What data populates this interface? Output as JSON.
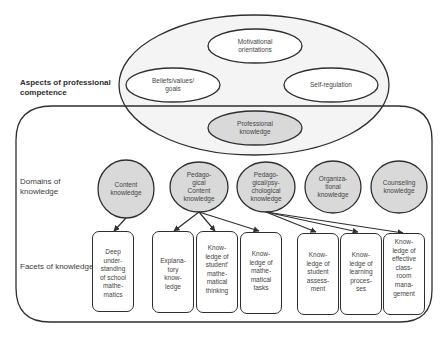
{
  "labels": {
    "aspects": "Aspects of professional\ncompetence",
    "domains": "Domains of\nknowledge",
    "facets": "Facets of knowledge"
  },
  "aspects": [
    {
      "id": "motivational",
      "text": "Motivational\norientations"
    },
    {
      "id": "beliefs",
      "text": "Beliefs/values/\ngoals"
    },
    {
      "id": "self_regulation",
      "text": "Self-regulation"
    },
    {
      "id": "professional_knowledge",
      "text": "Professional\nknowledge"
    }
  ],
  "domains": [
    {
      "id": "content",
      "text": "Content\nknowledge"
    },
    {
      "id": "pck",
      "text": "Pedago-\ngical\nContent\nknowledge"
    },
    {
      "id": "ppk",
      "text": "Pedago-\ngical/psy-\nchological\nknowledge"
    },
    {
      "id": "organizational",
      "text": "Organiza-\ntional\nknowledge"
    },
    {
      "id": "counseling",
      "text": "Counseling\nknowledge"
    }
  ],
  "facets": [
    {
      "id": "deep_understanding",
      "domain": "content",
      "text": "Deep\nunder-\nstanding\nof school\nmathe-\nmatics"
    },
    {
      "id": "explanatory",
      "domain": "pck",
      "text": "Explana-\ntory\nknow-\nledge"
    },
    {
      "id": "student_thinking",
      "domain": "pck",
      "text": "Know-\nledge of\nstudent'\nmathe-\nmatical\nthinking"
    },
    {
      "id": "math_tasks",
      "domain": "pck",
      "text": "Know-\nledge of\nmathe-\nmatical\ntasks"
    },
    {
      "id": "assessment",
      "domain": "ppk",
      "text": "Know-\nledge of\nstudent\nassess-\nment"
    },
    {
      "id": "learning",
      "domain": "ppk",
      "text": "Know-\nledge of\nlearning\nproces-\nses"
    },
    {
      "id": "classroom",
      "domain": "ppk",
      "text": "Know-\nledge of\neffective\nclass-\nroom\nmana-\ngement"
    }
  ],
  "colors": {
    "outline": "#2f2f2f",
    "grey_fill": "#d9d9d9",
    "big_ellipse_fill": "#f3f3f3",
    "white": "#ffffff"
  }
}
